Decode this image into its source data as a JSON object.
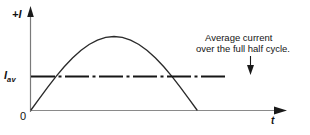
{
  "figure": {
    "background_color": "#ffffff",
    "ink_color": "#121212"
  },
  "axes": {
    "y_label": "+I",
    "x_label": "t",
    "origin_label": "0",
    "average_label_base": "I",
    "average_label_sub": "av"
  },
  "annotation": {
    "line1": "Average current",
    "line2": "over the full half cycle.",
    "pointer": "down-arrow"
  },
  "icons": {
    "y_axis_arrow": "arrow-up-icon",
    "x_axis_arrow": "arrow-right-icon",
    "callout_arrow": "arrow-down-icon"
  },
  "chart_data": {
    "type": "line",
    "title": "",
    "xlabel": "t",
    "ylabel": "+I",
    "grid": false,
    "legend": null,
    "xlim": [
      0,
      1.25
    ],
    "ylim": [
      0,
      1.15
    ],
    "series": [
      {
        "name": "instantaneous current (half sine wave)",
        "style": "solid",
        "x": [
          0.0,
          0.05,
          0.1,
          0.15,
          0.2,
          0.25,
          0.3,
          0.35,
          0.4,
          0.45,
          0.5,
          0.55,
          0.6,
          0.65,
          0.7,
          0.75,
          0.8,
          0.85,
          0.9,
          0.95,
          1.0
        ],
        "y": [
          0.0,
          0.156,
          0.309,
          0.454,
          0.588,
          0.707,
          0.809,
          0.891,
          0.951,
          0.988,
          1.0,
          0.988,
          0.951,
          0.891,
          0.809,
          0.707,
          0.588,
          0.454,
          0.309,
          0.156,
          0.0
        ]
      },
      {
        "name": "average current over the full half cycle",
        "style": "dash-dot",
        "constant_value": 0.455,
        "x": [
          0.0,
          1.18
        ],
        "y": [
          0.455,
          0.455
        ]
      }
    ],
    "annotations": [
      {
        "text": "Average current over the full half cycle.",
        "points_to_series": "average current over the full half cycle"
      }
    ],
    "tick_labels": {
      "x": [
        "0"
      ],
      "y": [
        "I av"
      ]
    }
  }
}
